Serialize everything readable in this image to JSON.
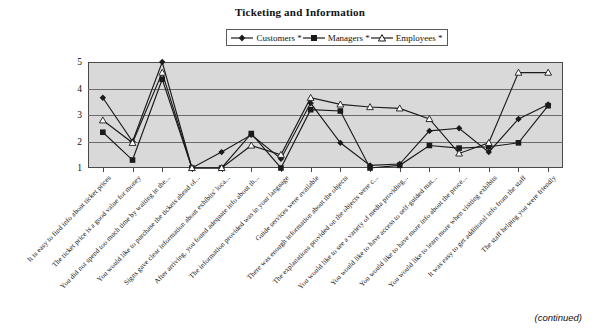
{
  "figure": {
    "title": "Ticketing and Information",
    "footer_note": "(continued)"
  },
  "legend": {
    "position": "top-center",
    "items": [
      {
        "label": "Customers *",
        "marker": "filled-diamond",
        "color": "#1a1a1a"
      },
      {
        "label": "Managers *",
        "marker": "filled-square",
        "color": "#1a1a1a"
      },
      {
        "label": "Employees *",
        "marker": "open-triangle",
        "color": "#1a1a1a"
      }
    ]
  },
  "axes": {
    "y_ticks": [
      "1",
      "2",
      "3",
      "4",
      "5"
    ],
    "y_min": 1,
    "y_max": 5,
    "grid": true,
    "plot_background": "#d9d9d9"
  },
  "chart_data": {
    "type": "line",
    "title": "Ticketing and Information",
    "xlabel": "",
    "ylabel": "",
    "ylim": [
      1,
      5
    ],
    "yticks": [
      1,
      2,
      3,
      4,
      5
    ],
    "grid": true,
    "legend_position": "top-center",
    "categories": [
      "It is easy to find info about ticket prices",
      "The ticket price is a good value for money",
      "You did not spend too much time by waiting in the...",
      "You would like to purchase the tickets ahead of...",
      "Signs gave clear information about exhibits' loca...",
      "After arriving, you found adequate info about th...",
      "The information provided was in your language",
      "Guide services were available",
      "There was enough information about the objects",
      "The explanations provided on the objects were c...",
      "You would like to see a variety of media providing...",
      "You would like to have access to self-guided mat...",
      "You would like to have more info about the proce...",
      "You would like to learn more when visiting exhibits",
      "It was easy to get additional info from the staff",
      "The staff helping you were friendly"
    ],
    "series": [
      {
        "name": "Customers *",
        "marker": "filled-diamond",
        "color": "#1a1a1a",
        "values": [
          3.65,
          2.0,
          5.0,
          1.0,
          1.6,
          2.25,
          1.35,
          3.45,
          1.95,
          1.1,
          1.15,
          2.4,
          2.5,
          1.6,
          2.85,
          3.4
        ]
      },
      {
        "name": "Managers *",
        "marker": "filled-square",
        "color": "#1a1a1a",
        "values": [
          2.35,
          1.3,
          4.35,
          1.0,
          1.0,
          2.3,
          1.0,
          3.2,
          3.15,
          1.0,
          1.1,
          1.85,
          1.75,
          1.8,
          1.95,
          3.35
        ]
      },
      {
        "name": "Employees *",
        "marker": "open-triangle",
        "color": "#1a1a1a",
        "values": [
          2.8,
          1.95,
          4.6,
          1.0,
          1.0,
          1.85,
          1.5,
          3.65,
          3.4,
          3.3,
          3.25,
          2.85,
          1.55,
          1.95,
          4.6,
          4.6
        ]
      }
    ]
  }
}
